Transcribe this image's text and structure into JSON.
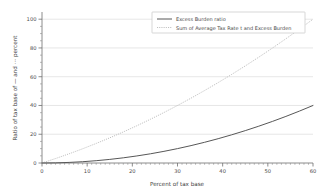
{
  "chart_data": {
    "type": "line",
    "title": "",
    "xlabel": "Percent of tax base",
    "ylabel": "Ratio of tax base of — and ⋯ percent",
    "xlim": [
      0,
      60
    ],
    "ylim": [
      0,
      105
    ],
    "xticks": [
      0,
      10,
      20,
      30,
      40,
      50,
      60
    ],
    "yticks": [
      0,
      20,
      40,
      60,
      80,
      100
    ],
    "grid": "horizontal",
    "legend_position": "top-right",
    "x": [
      0,
      3,
      6,
      9,
      12,
      15,
      18,
      21,
      24,
      27,
      30,
      33,
      36,
      39,
      42,
      45,
      48,
      51,
      54,
      57,
      60
    ],
    "series": [
      {
        "name": "Excess Burden ratio",
        "style": "solid",
        "color": "#575757",
        "values": [
          0,
          0.1,
          0.4,
          0.9,
          1.6,
          2.5,
          3.6,
          4.9,
          6.4,
          8.1,
          10.0,
          12.1,
          14.4,
          16.9,
          19.6,
          22.5,
          25.6,
          28.9,
          32.4,
          36.1,
          40.0
        ]
      },
      {
        "name": "Sum of Average Tax Rate t and Excess Burden",
        "style": "dotted",
        "color": "#b9b9b9",
        "values": [
          0,
          3.1,
          6.4,
          9.9,
          13.6,
          17.5,
          21.6,
          25.9,
          30.4,
          35.1,
          40.0,
          45.1,
          50.4,
          55.9,
          61.6,
          67.5,
          73.6,
          79.9,
          86.4,
          93.1,
          100.0
        ]
      }
    ]
  },
  "legend": {
    "entries": [
      {
        "label": "Excess Burden ratio"
      },
      {
        "label": "Sum of Average Tax Rate t and Excess Burden"
      }
    ]
  },
  "axes": {
    "x_title": "Percent of tax base",
    "y_title": "Ratio of tax base of — and ⋯ percent",
    "x_tick_labels": [
      "0",
      "10",
      "20",
      "30",
      "40",
      "50",
      "60"
    ],
    "y_tick_labels": [
      "0",
      "20",
      "40",
      "60",
      "80",
      "100"
    ]
  }
}
